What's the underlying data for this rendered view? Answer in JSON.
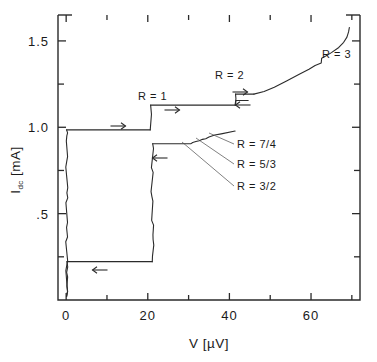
{
  "chart_data": {
    "type": "line",
    "title": "",
    "xlabel": "V [µV]",
    "ylabel": "I_dc [mA]",
    "ylabel_base": "I",
    "ylabel_sub": "dc",
    "ylabel_unit": " [mA]",
    "xlim": [
      -2,
      72
    ],
    "ylim": [
      0,
      1.65
    ],
    "grid": false,
    "legend": "none",
    "xticks_major": [
      0,
      20,
      40,
      60
    ],
    "xticklabels": [
      "0",
      "20",
      "40",
      "60"
    ],
    "xticks_minor": [
      10,
      30,
      50,
      70
    ],
    "yticks_major": [
      0.5,
      1.0,
      1.5
    ],
    "yticklabels": [
      ".5",
      "1.0",
      "1.5"
    ],
    "yticks_minor": [
      0.25,
      0.75,
      1.25
    ],
    "series": [
      {
        "name": "supercurrent-branch-up",
        "comment": "zero-voltage branch rising along V=0 to critical current",
        "points": [
          [
            0.1,
            0.02
          ],
          [
            0.15,
            0.2
          ],
          [
            0.1,
            0.42
          ],
          [
            0.18,
            0.62
          ],
          [
            0.12,
            0.8
          ],
          [
            0.16,
            0.95
          ],
          [
            0.1,
            0.985
          ]
        ]
      },
      {
        "name": "switch-to-R1-step",
        "comment": "horizontal jump at I = 0.985 mA from V=0 to R=1 step edge",
        "points": [
          [
            0.1,
            0.985
          ],
          [
            20.6,
            0.985
          ]
        ]
      },
      {
        "name": "R1-step-rise",
        "comment": "vertical rise onto the R = 1 constant-voltage step",
        "points": [
          [
            20.6,
            0.985
          ],
          [
            20.9,
            1.075
          ],
          [
            20.7,
            1.128
          ]
        ]
      },
      {
        "name": "R1-plateau",
        "comment": "R = 1 Shapiro-like constant voltage step",
        "points": [
          [
            20.7,
            1.128
          ],
          [
            41.4,
            1.128
          ]
        ]
      },
      {
        "name": "R2-rise",
        "comment": "vertical jump from R=1 plateau up to R = 2 step",
        "points": [
          [
            41.4,
            1.128
          ],
          [
            41.6,
            1.165
          ],
          [
            41.5,
            1.192
          ]
        ]
      },
      {
        "name": "R2-plateau",
        "comment": "short R = 2 constant voltage step",
        "points": [
          [
            41.5,
            1.192
          ],
          [
            46.0,
            1.192
          ]
        ]
      },
      {
        "name": "R3-branch",
        "comment": "rising finite-voltage branch containing the R = 3 step",
        "points": [
          [
            46.0,
            1.192
          ],
          [
            48.5,
            1.207
          ],
          [
            51.0,
            1.232
          ],
          [
            54.0,
            1.268
          ],
          [
            57.0,
            1.305
          ],
          [
            59.5,
            1.336
          ],
          [
            61.0,
            1.358
          ],
          [
            62.5,
            1.372
          ],
          [
            62.6,
            1.4
          ],
          [
            63.6,
            1.412
          ],
          [
            65.0,
            1.432
          ],
          [
            66.8,
            1.462
          ],
          [
            68.0,
            1.492
          ],
          [
            68.8,
            1.522
          ],
          [
            69.2,
            1.552
          ],
          [
            69.4,
            1.578
          ]
        ]
      },
      {
        "name": "return-branch-R2",
        "comment": "downward sweep: drop from R = 2 step back onto R = 1 plateau",
        "points": [
          [
            44.6,
            1.155
          ],
          [
            41.6,
            1.155
          ],
          [
            41.5,
            1.128
          ]
        ]
      },
      {
        "name": "return-branch-lower",
        "comment": "downward sweep along the lower retrapping branch with 7/4, 5/3, 3/2 substeps",
        "points": [
          [
            41.4,
            0.978
          ],
          [
            38.0,
            0.962
          ],
          [
            36.4,
            0.955
          ],
          [
            35.0,
            0.944
          ],
          [
            34.2,
            0.934
          ],
          [
            33.4,
            0.93
          ],
          [
            32.6,
            0.922
          ],
          [
            31.8,
            0.918
          ],
          [
            31.0,
            0.912
          ],
          [
            30.6,
            0.905
          ],
          [
            21.2,
            0.905
          ]
        ]
      },
      {
        "name": "return-branch-drop",
        "comment": "vertical retrapping drop at V ~ 21 uV down to low current",
        "points": [
          [
            21.2,
            0.905
          ],
          [
            21.0,
            0.6
          ],
          [
            21.3,
            0.35
          ],
          [
            21.1,
            0.222
          ]
        ]
      },
      {
        "name": "return-to-zero",
        "comment": "horizontal return at I = 0.222 mA to the zero-voltage axis",
        "points": [
          [
            21.1,
            0.222
          ],
          [
            0.2,
            0.222
          ]
        ]
      },
      {
        "name": "zero-axis-tail",
        "comment": "noisy zero-voltage branch below retrapping current",
        "points": [
          [
            0.2,
            0.222
          ],
          [
            0.12,
            0.16
          ],
          [
            0.18,
            0.08
          ],
          [
            0.1,
            0.02
          ]
        ]
      }
    ],
    "step_labels": [
      {
        "id": "R1",
        "text": "R = 1",
        "x": 138,
        "y": 100
      },
      {
        "id": "R2",
        "text": "R = 2",
        "x": 215,
        "y": 79
      },
      {
        "id": "R3",
        "text": "R = 3",
        "x": 322,
        "y": 58
      },
      {
        "id": "R74",
        "text": "R = 7/4",
        "x": 237,
        "y": 148
      },
      {
        "id": "R53",
        "text": "R = 5/3",
        "x": 237,
        "y": 168
      },
      {
        "id": "R32",
        "text": "R = 3/2",
        "x": 237,
        "y": 190
      }
    ],
    "leader_lines": [
      {
        "id": "leader-7-4",
        "from": [
          234,
          144
        ],
        "to": [
          209,
          133
        ]
      },
      {
        "id": "leader-5-3",
        "from": [
          234,
          164
        ],
        "to": [
          196,
          138
        ]
      },
      {
        "id": "leader-3-2",
        "from": [
          234,
          186
        ],
        "to": [
          182,
          142
        ]
      }
    ],
    "sweep_arrows": [
      {
        "id": "arrow-up-sweep-low",
        "direction": "right",
        "x": 118,
        "y": 126
      },
      {
        "id": "arrow-up-sweep-r1",
        "direction": "right",
        "x": 172,
        "y": 110
      },
      {
        "id": "arrow-up-sweep-r2",
        "direction": "right",
        "x": 240,
        "y": 92
      },
      {
        "id": "arrow-down-sweep-r2",
        "direction": "left",
        "x": 243,
        "y": 105
      },
      {
        "id": "arrow-down-sweep-r1",
        "direction": "left",
        "x": 160,
        "y": 158
      },
      {
        "id": "arrow-down-sweep-low",
        "direction": "left",
        "x": 100,
        "y": 270
      }
    ]
  },
  "figure": {
    "plot_left": 58,
    "plot_right": 360,
    "plot_top": 15,
    "plot_bottom": 300
  }
}
